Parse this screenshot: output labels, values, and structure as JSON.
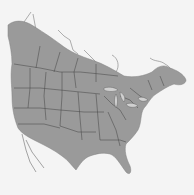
{
  "map": {
    "subject": "North America range map",
    "colors": {
      "background": "#f4f4f4",
      "land": "#9a9a9a",
      "range_shade": "#8c8c8c",
      "borders": "#4a4a4a",
      "outline_land": "#d8d8d8"
    },
    "regions": [
      "Canada",
      "United States",
      "Mexico (Baja California)"
    ],
    "shaded_range": "Northern band across southern Canada plus contiguous United States"
  }
}
